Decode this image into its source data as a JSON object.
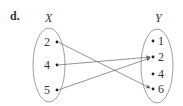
{
  "problem_label": "d.",
  "domain_set": {
    "name": "X",
    "elements": [
      "2",
      "4",
      "5"
    ]
  },
  "range_set": {
    "name": "Y",
    "elements": [
      "1",
      "2",
      "4",
      "6"
    ]
  },
  "mappings": [
    {
      "from": "2",
      "to": "6"
    },
    {
      "from": "4",
      "to": "2"
    },
    {
      "from": "5",
      "to": "2"
    }
  ]
}
